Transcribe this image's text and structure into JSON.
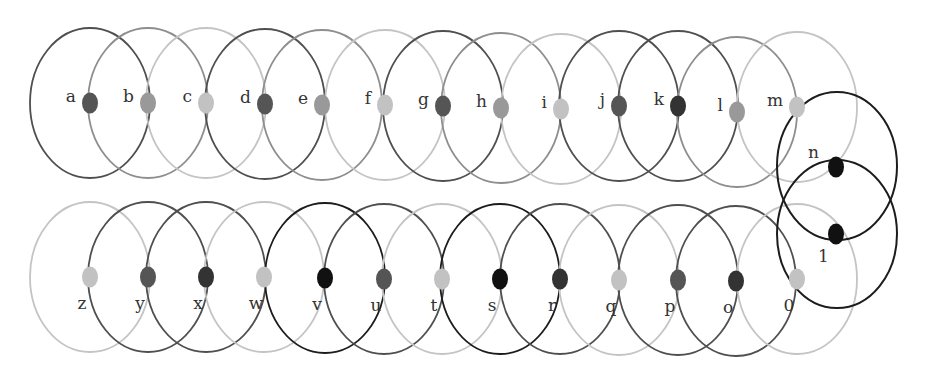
{
  "diagram": {
    "title": "",
    "shades": {
      "black": "#1c1c1c",
      "dark": "#4f4f4f",
      "medium": "#8e8e8e",
      "light": "#c4c4c4"
    },
    "dot_shades": {
      "black": "#111111",
      "darker": "#333333",
      "dark": "#555555",
      "medium": "#999999",
      "light": "#c2c2c2"
    },
    "radius": {
      "rx": 60,
      "ry": 75
    },
    "top_row": [
      {
        "label": "a",
        "cx": 90,
        "cy": 103,
        "ring": "dark",
        "dot": "dark"
      },
      {
        "label": "b",
        "cx": 148,
        "cy": 103,
        "ring": "medium",
        "dot": "medium"
      },
      {
        "label": "c",
        "cx": 206,
        "cy": 103,
        "ring": "light",
        "dot": "light"
      },
      {
        "label": "d",
        "cx": 265,
        "cy": 104,
        "ring": "dark",
        "dot": "dark"
      },
      {
        "label": "e",
        "cx": 322,
        "cy": 105,
        "ring": "medium",
        "dot": "medium"
      },
      {
        "label": "f",
        "cx": 385,
        "cy": 105,
        "ring": "light",
        "dot": "light"
      },
      {
        "label": "g",
        "cx": 443,
        "cy": 106,
        "ring": "dark",
        "dot": "dark"
      },
      {
        "label": "h",
        "cx": 501,
        "cy": 108,
        "ring": "medium",
        "dot": "medium"
      },
      {
        "label": "i",
        "cx": 561,
        "cy": 109,
        "ring": "light",
        "dot": "light"
      },
      {
        "label": "j",
        "cx": 619,
        "cy": 106,
        "ring": "dark",
        "dot": "dark"
      },
      {
        "label": "k",
        "cx": 678,
        "cy": 106,
        "ring": "dark",
        "dot": "darker"
      },
      {
        "label": "l",
        "cx": 737,
        "cy": 112,
        "ring": "medium",
        "dot": "medium"
      },
      {
        "label": "m",
        "cx": 797,
        "cy": 107,
        "ring": "light",
        "dot": "light"
      }
    ],
    "bottom_row": [
      {
        "label": "z",
        "cx": 90,
        "cy": 277,
        "ring": "light",
        "dot": "light"
      },
      {
        "label": "y",
        "cx": 148,
        "cy": 277,
        "ring": "dark",
        "dot": "dark"
      },
      {
        "label": "x",
        "cx": 206,
        "cy": 277,
        "ring": "dark",
        "dot": "darker"
      },
      {
        "label": "w",
        "cx": 264,
        "cy": 277,
        "ring": "light",
        "dot": "light"
      },
      {
        "label": "v",
        "cx": 325,
        "cy": 278,
        "ring": "black",
        "dot": "black"
      },
      {
        "label": "u",
        "cx": 384,
        "cy": 279,
        "ring": "dark",
        "dot": "dark"
      },
      {
        "label": "t",
        "cx": 442,
        "cy": 279,
        "ring": "light",
        "dot": "light"
      },
      {
        "label": "s",
        "cx": 500,
        "cy": 279,
        "ring": "black",
        "dot": "black"
      },
      {
        "label": "r",
        "cx": 560,
        "cy": 279,
        "ring": "dark",
        "dot": "darker"
      },
      {
        "label": "q",
        "cx": 619,
        "cy": 280,
        "ring": "light",
        "dot": "light"
      },
      {
        "label": "p",
        "cx": 678,
        "cy": 280,
        "ring": "dark",
        "dot": "dark"
      },
      {
        "label": "o",
        "cx": 736,
        "cy": 281,
        "ring": "dark",
        "dot": "darker"
      },
      {
        "label": "0",
        "cx": 797,
        "cy": 279,
        "ring": "light",
        "dot": "light"
      }
    ],
    "connectors": [
      {
        "label": "n",
        "ring_cx": 837,
        "ring_cy": 166,
        "dot_cx": 836,
        "dot_cy": 167,
        "ring": "black",
        "dot": "black",
        "label_x": 808,
        "label_y": 158
      },
      {
        "label": "1",
        "ring_cx": 837,
        "ring_cy": 234,
        "dot_cx": 836,
        "dot_cy": 234,
        "ring": "black",
        "dot": "black",
        "label_x": 818,
        "label_y": 262
      }
    ]
  }
}
